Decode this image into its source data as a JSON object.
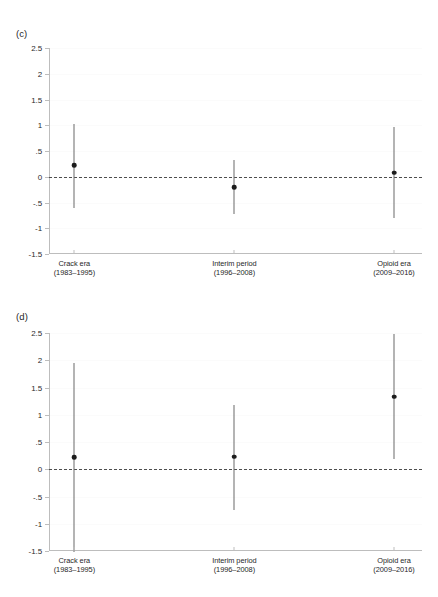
{
  "figure": {
    "ghost_header": "",
    "background_color": "#ffffff",
    "marker_color": "#1c1c1c",
    "errorbar_color": "#6b6b6b",
    "axis_color": "#bdbdbd",
    "zero_line_color": "#4d4d4d"
  },
  "panels": [
    {
      "id": "c",
      "label": "(c)"
    },
    {
      "id": "d",
      "label": "(d)"
    }
  ],
  "axis": {
    "y_tick_labels": [
      "2.5",
      "2",
      "1.5",
      "1",
      ".5",
      "0",
      "-.5",
      "-1",
      "-1.5"
    ],
    "y_tick_values": [
      2.5,
      2,
      1.5,
      1,
      0.5,
      0,
      -0.5,
      -1,
      -1.5
    ],
    "x_categories": [
      {
        "line1": "Crack era",
        "line2": "(1983–1995)"
      },
      {
        "line1": "Interim period",
        "line2": "(1996–2008)"
      },
      {
        "line1": "Opioid era",
        "line2": "(2009–2016)"
      }
    ]
  },
  "chart_data": [
    {
      "type": "scatter",
      "panel": "c",
      "title": "(c)",
      "xlabel": "",
      "ylabel": "",
      "ylim": [
        -1.5,
        2.5
      ],
      "yticks": [
        -1.5,
        -1,
        -0.5,
        0,
        0.5,
        1,
        1.5,
        2,
        2.5
      ],
      "ytick_labels": [
        "-1.5",
        "-1",
        "-.5",
        "0",
        ".5",
        "1",
        "1.5",
        "2",
        "2.5"
      ],
      "grid": true,
      "legend": "none",
      "reference_line": 0,
      "categories": [
        "Crack era (1983–1995)",
        "Interim period (1996–2008)",
        "Opioid era (2009–2016)"
      ],
      "series": [
        {
          "name": "point estimate",
          "values": [
            0.22,
            -0.2,
            0.08
          ],
          "ci_low": [
            -0.6,
            -0.72,
            -0.8
          ],
          "ci_high": [
            1.03,
            0.32,
            0.96
          ]
        }
      ]
    },
    {
      "type": "scatter",
      "panel": "d",
      "title": "(d)",
      "xlabel": "",
      "ylabel": "",
      "ylim": [
        -1.5,
        2.5
      ],
      "yticks": [
        -1.5,
        -1,
        -0.5,
        0,
        0.5,
        1,
        1.5,
        2,
        2.5
      ],
      "ytick_labels": [
        "-1.5",
        "-1",
        "-.5",
        "0",
        ".5",
        "1",
        "1.5",
        "2",
        "2.5"
      ],
      "grid": true,
      "legend": "none",
      "reference_line": 0,
      "categories": [
        "Crack era (1983–1995)",
        "Interim period (1996–2008)",
        "Opioid era (2009–2016)"
      ],
      "series": [
        {
          "name": "point estimate",
          "values": [
            0.22,
            0.23,
            1.33
          ],
          "ci_low": [
            -1.52,
            -0.75,
            0.19
          ],
          "ci_high": [
            1.95,
            1.18,
            2.49
          ]
        }
      ]
    }
  ]
}
